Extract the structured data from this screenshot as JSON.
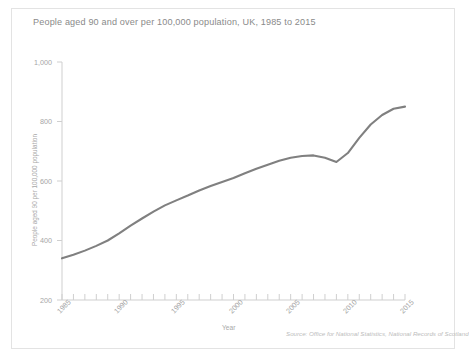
{
  "chart_data": {
    "type": "line",
    "title": "People aged 90 and over per 100,000 population, UK, 1985 to 2015",
    "xlabel": "Year",
    "ylabel": "People aged 90 per 100,000 population",
    "source": "Source: Office for National Statistics, National Records of Scotland",
    "grid": false,
    "legend": "none",
    "line_color": "#808080",
    "axis_color": "#cfcfcf",
    "text_color": "#a6a6a6",
    "xlim": [
      1985,
      2015
    ],
    "ylim": [
      200,
      1000
    ],
    "yticks": [
      200,
      400,
      600,
      800,
      1000
    ],
    "ytick_labels": [
      "200",
      "400",
      "600",
      "800",
      "1,000"
    ],
    "xticks": [
      1985,
      1990,
      1995,
      2000,
      2005,
      2010,
      2015
    ],
    "xtick_labels": [
      "1985",
      "1990",
      "1995",
      "2000",
      "2005",
      "2010",
      "2015"
    ],
    "x_minor_tick_interval": 1,
    "x": [
      1985,
      1986,
      1987,
      1988,
      1989,
      1990,
      1991,
      1992,
      1993,
      1994,
      1995,
      1996,
      1997,
      1998,
      1999,
      2000,
      2001,
      2002,
      2003,
      2004,
      2005,
      2006,
      2007,
      2008,
      2009,
      2010,
      2011,
      2012,
      2013,
      2014,
      2015
    ],
    "values": [
      340,
      352,
      366,
      382,
      400,
      424,
      450,
      474,
      497,
      518,
      535,
      551,
      568,
      583,
      597,
      610,
      626,
      641,
      655,
      668,
      678,
      684,
      686,
      678,
      664,
      694,
      745,
      790,
      822,
      843,
      850
    ],
    "series": [
      {
        "name": "People aged 90 and over per 100,000 population",
        "values": [
          340,
          352,
          366,
          382,
          400,
          424,
          450,
          474,
          497,
          518,
          535,
          551,
          568,
          583,
          597,
          610,
          626,
          641,
          655,
          668,
          678,
          684,
          686,
          678,
          664,
          694,
          745,
          790,
          822,
          843,
          850
        ]
      }
    ]
  }
}
